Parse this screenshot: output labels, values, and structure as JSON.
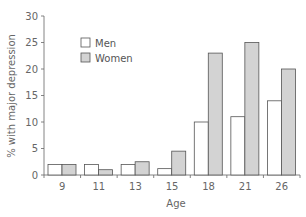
{
  "chart_data": {
    "type": "bar",
    "title": "",
    "xlabel": "Age",
    "ylabel": "% with major depression",
    "categories": [
      "9",
      "11",
      "13",
      "15",
      "18",
      "21",
      "26"
    ],
    "series": [
      {
        "name": "Men",
        "color": "#ffffff",
        "values": [
          2,
          2,
          2,
          1.2,
          10,
          11,
          14
        ]
      },
      {
        "name": "Women",
        "color": "#d3d3d3",
        "values": [
          2,
          1,
          2.5,
          4.5,
          23,
          25,
          20
        ]
      }
    ],
    "ylim": [
      0,
      30
    ],
    "yticks": [
      0,
      5,
      10,
      15,
      20,
      25,
      30
    ],
    "grid": false,
    "legend_position": "upper-left"
  },
  "legend": {
    "items": [
      {
        "label": "Men",
        "color": "#ffffff"
      },
      {
        "label": "Women",
        "color": "#d3d3d3"
      }
    ]
  }
}
